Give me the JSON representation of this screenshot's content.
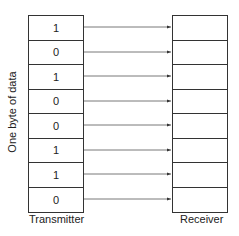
{
  "transmitter": {
    "label": "Transmitter",
    "bits": [
      "1",
      "0",
      "1",
      "0",
      "0",
      "1",
      "1",
      "0"
    ]
  },
  "receiver": {
    "label": "Receiver",
    "bits": [
      "",
      "",
      "",
      "",
      "",
      "",
      "",
      ""
    ]
  },
  "side_label": "One byte of data",
  "arrow_count": 8
}
